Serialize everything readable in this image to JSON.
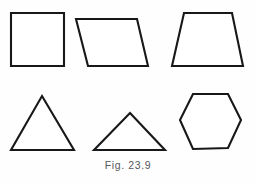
{
  "figure": {
    "caption": "Fig. 23.9",
    "background_color": "#fefefe",
    "stroke_color": "#17181a",
    "fill_color": "#ffffff",
    "caption_color": "#55585c",
    "width": 256,
    "height": 185
  },
  "shapes": [
    {
      "id": "square",
      "name": "square",
      "row": "top",
      "column": 1,
      "sides": 4,
      "points": "11,13 64,13 64,66 11,66"
    },
    {
      "id": "parallelogram",
      "name": "parallelogram",
      "row": "top",
      "column": 2,
      "sides": 4,
      "points": "76,19 137,19 148,66 88,66"
    },
    {
      "id": "trapezoid",
      "name": "trapezoid",
      "row": "top",
      "column": 3,
      "sides": 4,
      "points": "184,13 232,13 243,66 172,66"
    },
    {
      "id": "equilateral-triangle",
      "name": "equilateral triangle",
      "row": "bottom",
      "column": 1,
      "sides": 3,
      "points": "42,96 74,150 11,150"
    },
    {
      "id": "isosceles-triangle",
      "name": "isosceles triangle",
      "row": "bottom",
      "column": 2,
      "sides": 3,
      "points": "130,113 165,150 94,150"
    },
    {
      "id": "hexagon",
      "name": "regular hexagon",
      "row": "bottom",
      "column": 3,
      "sides": 6,
      "points": "193,94 228,94 241,120 228,148 193,149 180,120"
    }
  ]
}
